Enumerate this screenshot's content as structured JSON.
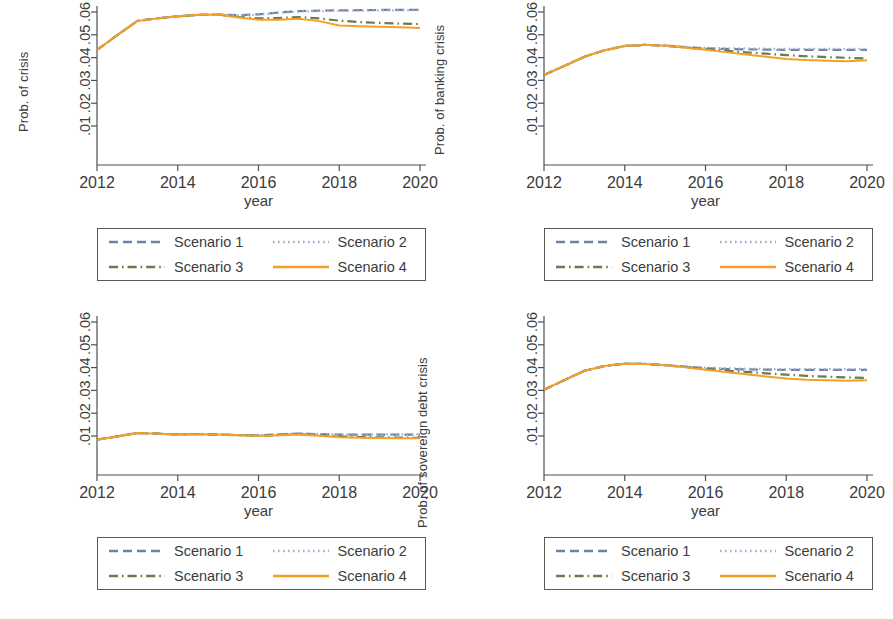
{
  "figure": {
    "width": 893,
    "height": 619,
    "background": "#ffffff"
  },
  "series_styles": [
    {
      "name": "Scenario 1",
      "color": "#6e80a6",
      "dash": "dashed"
    },
    {
      "name": "Scenario 2",
      "color": "#9fb0cc",
      "dash": "dotted"
    },
    {
      "name": "Scenario 3",
      "color": "#6d7a4a",
      "dash": "dashdot"
    },
    {
      "name": "Scenario 4",
      "color": "#f4a028",
      "dash": "solid"
    }
  ],
  "legend": {
    "entries": [
      {
        "label": "Scenario 1",
        "color": "#6e80a6",
        "dash": "dashed"
      },
      {
        "label": "Scenario 2",
        "color": "#9fb0cc",
        "dash": "dotted"
      },
      {
        "label": "Scenario 3",
        "color": "#6d7a4a",
        "dash": "dashdot"
      },
      {
        "label": "Scenario 4",
        "color": "#f4a028",
        "dash": "solid"
      }
    ]
  },
  "panels": [
    {
      "id": "top-left",
      "ylabel_left": "Prob. of crisis",
      "ylabel_right": "",
      "xlabel": "year",
      "yticklabels": [
        ".01",
        ".02",
        ".03",
        ".04",
        ".05",
        ".06"
      ],
      "xticklabels": [
        "2012",
        "2014",
        "2016",
        "2018",
        "2020"
      ]
    },
    {
      "id": "top-right",
      "ylabel_left": "Prob. of banking crisis",
      "ylabel_right": "",
      "xlabel": "year",
      "yticklabels": [
        ".01",
        ".02",
        ".03",
        ".04",
        ".05",
        ".06"
      ],
      "xticklabels": [
        "2012",
        "2014",
        "2016",
        "2018",
        "2020"
      ]
    },
    {
      "id": "bottom-left",
      "ylabel_left": "",
      "ylabel_right": "",
      "xlabel": "year",
      "yticklabels": [
        ".01",
        ".02",
        ".03",
        ".04",
        ".05",
        ".06"
      ],
      "xticklabels": [
        "2012",
        "2014",
        "2016",
        "2018",
        "2020"
      ]
    },
    {
      "id": "bottom-right",
      "ylabel_left": "Prob. of sovereign debt crisis",
      "ylabel_right": "",
      "xlabel": "year",
      "yticklabels": [
        ".01",
        ".02",
        ".03",
        ".04",
        ".05",
        ".06"
      ],
      "xticklabels": [
        "2012",
        "2014",
        "2016",
        "2018",
        "2020"
      ]
    }
  ],
  "chart_data": [
    {
      "id": "top-left",
      "type": "line",
      "title": "",
      "xlabel": "year",
      "ylabel": "Prob. of crisis",
      "xlim": [
        2012,
        2020
      ],
      "ylim": [
        0.0,
        0.065
      ],
      "yticks": [
        0.01,
        0.02,
        0.03,
        0.04,
        0.05,
        0.06
      ],
      "xticks": [
        2012,
        2014,
        2016,
        2018,
        2020
      ],
      "grid": false,
      "legend_position": "below",
      "x": [
        2012,
        2012.5,
        2013,
        2013.5,
        2014,
        2014.5,
        2015,
        2015.5,
        2016,
        2016.5,
        2017,
        2017.5,
        2018,
        2018.5,
        2019,
        2019.5,
        2020
      ],
      "series": [
        {
          "name": "Scenario 1",
          "color": "#6e80a6",
          "dash": "dashed",
          "values": [
            0.0434,
            0.0498,
            0.0561,
            0.0572,
            0.0581,
            0.0587,
            0.0589,
            0.0586,
            0.059,
            0.0598,
            0.0604,
            0.0606,
            0.0607,
            0.0608,
            0.0609,
            0.0609,
            0.061
          ]
        },
        {
          "name": "Scenario 2",
          "color": "#9fb0cc",
          "dash": "dotted",
          "values": [
            0.0434,
            0.0498,
            0.0561,
            0.0572,
            0.0581,
            0.0587,
            0.0589,
            0.0585,
            0.0588,
            0.0596,
            0.0602,
            0.0604,
            0.0605,
            0.0606,
            0.0607,
            0.0607,
            0.0608
          ]
        },
        {
          "name": "Scenario 3",
          "color": "#6d7a4a",
          "dash": "dashdot",
          "values": [
            0.0434,
            0.0498,
            0.0561,
            0.0572,
            0.0581,
            0.0587,
            0.0589,
            0.0578,
            0.0572,
            0.0574,
            0.0578,
            0.0572,
            0.0562,
            0.0556,
            0.0552,
            0.0549,
            0.0547
          ]
        },
        {
          "name": "Scenario 4",
          "color": "#f4a028",
          "dash": "solid",
          "values": [
            0.0434,
            0.0498,
            0.0561,
            0.0572,
            0.0581,
            0.0587,
            0.0589,
            0.0576,
            0.0566,
            0.0566,
            0.057,
            0.056,
            0.0541,
            0.0538,
            0.0535,
            0.0533,
            0.053
          ]
        }
      ]
    },
    {
      "id": "top-right",
      "type": "line",
      "title": "",
      "xlabel": "year",
      "ylabel": "Prob. of banking crisis",
      "xlim": [
        2012,
        2020
      ],
      "ylim": [
        0.0,
        0.065
      ],
      "yticks": [
        0.01,
        0.02,
        0.03,
        0.04,
        0.05,
        0.06
      ],
      "xticks": [
        2012,
        2014,
        2016,
        2018,
        2020
      ],
      "grid": false,
      "legend_position": "below",
      "x": [
        2012,
        2012.5,
        2013,
        2013.5,
        2014,
        2014.5,
        2015,
        2015.5,
        2016,
        2016.5,
        2017,
        2017.5,
        2018,
        2018.5,
        2019,
        2019.5,
        2020
      ],
      "series": [
        {
          "name": "Scenario 1",
          "color": "#6e80a6",
          "dash": "dashed",
          "values": [
            0.0324,
            0.0363,
            0.0404,
            0.0432,
            0.0451,
            0.0456,
            0.0453,
            0.0446,
            0.0441,
            0.0438,
            0.0436,
            0.0435,
            0.0434,
            0.0434,
            0.0434,
            0.0434,
            0.0434
          ]
        },
        {
          "name": "Scenario 2",
          "color": "#9fb0cc",
          "dash": "dotted",
          "values": [
            0.0324,
            0.0363,
            0.0404,
            0.0432,
            0.0451,
            0.0456,
            0.0453,
            0.0447,
            0.0443,
            0.0441,
            0.044,
            0.0439,
            0.0438,
            0.0438,
            0.0438,
            0.0438,
            0.0438
          ]
        },
        {
          "name": "Scenario 3",
          "color": "#6d7a4a",
          "dash": "dashdot",
          "values": [
            0.0324,
            0.0363,
            0.0404,
            0.0432,
            0.0451,
            0.0456,
            0.0452,
            0.0444,
            0.0437,
            0.043,
            0.0423,
            0.0417,
            0.0411,
            0.0406,
            0.0402,
            0.0399,
            0.0396
          ]
        },
        {
          "name": "Scenario 4",
          "color": "#f4a028",
          "dash": "solid",
          "values": [
            0.0324,
            0.0363,
            0.0404,
            0.0432,
            0.0451,
            0.0456,
            0.0452,
            0.0443,
            0.0434,
            0.0424,
            0.0414,
            0.0404,
            0.0394,
            0.0389,
            0.0386,
            0.0384,
            0.0388
          ]
        }
      ]
    },
    {
      "id": "bottom-left",
      "type": "line",
      "title": "",
      "xlabel": "year",
      "ylabel": "",
      "xlim": [
        2012,
        2020
      ],
      "ylim": [
        0.0,
        0.065
      ],
      "yticks": [
        0.01,
        0.02,
        0.03,
        0.04,
        0.05,
        0.06
      ],
      "xticks": [
        2012,
        2014,
        2016,
        2018,
        2020
      ],
      "grid": false,
      "legend_position": "below",
      "x": [
        2012,
        2012.5,
        2013,
        2013.5,
        2014,
        2014.5,
        2015,
        2015.5,
        2016,
        2016.5,
        2017,
        2017.5,
        2018,
        2018.5,
        2019,
        2019.5,
        2020
      ],
      "series": [
        {
          "name": "Scenario 1",
          "color": "#6e80a6",
          "dash": "dashed",
          "values": [
            0.0084,
            0.0098,
            0.0113,
            0.011,
            0.0107,
            0.0108,
            0.0107,
            0.0104,
            0.0103,
            0.0107,
            0.0111,
            0.0108,
            0.0106,
            0.0106,
            0.0106,
            0.0106,
            0.0106
          ]
        },
        {
          "name": "Scenario 2",
          "color": "#9fb0cc",
          "dash": "dotted",
          "values": [
            0.0084,
            0.0098,
            0.0113,
            0.011,
            0.0107,
            0.0108,
            0.0107,
            0.0104,
            0.0104,
            0.0108,
            0.0112,
            0.0109,
            0.0107,
            0.0107,
            0.0107,
            0.0107,
            0.0107
          ]
        },
        {
          "name": "Scenario 3",
          "color": "#6d7a4a",
          "dash": "dashdot",
          "values": [
            0.0084,
            0.0098,
            0.0113,
            0.011,
            0.0107,
            0.0108,
            0.0107,
            0.0103,
            0.0101,
            0.0104,
            0.0108,
            0.0103,
            0.0098,
            0.0096,
            0.0094,
            0.0093,
            0.0092
          ]
        },
        {
          "name": "Scenario 4",
          "color": "#f4a028",
          "dash": "solid",
          "values": [
            0.0084,
            0.0098,
            0.0113,
            0.011,
            0.0107,
            0.0108,
            0.0107,
            0.0103,
            0.01,
            0.0103,
            0.0107,
            0.0101,
            0.0094,
            0.0092,
            0.0091,
            0.009,
            0.009
          ]
        }
      ]
    },
    {
      "id": "bottom-right",
      "type": "line",
      "title": "",
      "xlabel": "year",
      "ylabel": "Prob. of sovereign debt crisis",
      "xlim": [
        2012,
        2020
      ],
      "ylim": [
        0.0,
        0.065
      ],
      "yticks": [
        0.01,
        0.02,
        0.03,
        0.04,
        0.05,
        0.06
      ],
      "xticks": [
        2012,
        2014,
        2016,
        2018,
        2020
      ],
      "grid": false,
      "legend_position": "below",
      "x": [
        2012,
        2012.5,
        2013,
        2013.5,
        2014,
        2014.5,
        2015,
        2015.5,
        2016,
        2016.5,
        2017,
        2017.5,
        2018,
        2018.5,
        2019,
        2019.5,
        2020
      ],
      "series": [
        {
          "name": "Scenario 1",
          "color": "#6e80a6",
          "dash": "dashed",
          "values": [
            0.0303,
            0.0345,
            0.0386,
            0.0407,
            0.0417,
            0.0416,
            0.0411,
            0.0404,
            0.0398,
            0.0394,
            0.0392,
            0.0391,
            0.039,
            0.039,
            0.039,
            0.039,
            0.039
          ]
        },
        {
          "name": "Scenario 2",
          "color": "#9fb0cc",
          "dash": "dotted",
          "values": [
            0.0303,
            0.0345,
            0.0386,
            0.0407,
            0.0417,
            0.0416,
            0.0411,
            0.0405,
            0.04,
            0.0397,
            0.0395,
            0.0394,
            0.0393,
            0.0393,
            0.0393,
            0.0393,
            0.0393
          ]
        },
        {
          "name": "Scenario 3",
          "color": "#6d7a4a",
          "dash": "dashdot",
          "values": [
            0.0303,
            0.0345,
            0.0386,
            0.0407,
            0.0417,
            0.0416,
            0.041,
            0.0402,
            0.0394,
            0.0387,
            0.0381,
            0.0375,
            0.0369,
            0.0364,
            0.036,
            0.0357,
            0.0355
          ]
        },
        {
          "name": "Scenario 4",
          "color": "#f4a028",
          "dash": "solid",
          "values": [
            0.0303,
            0.0345,
            0.0386,
            0.0407,
            0.0417,
            0.0416,
            0.041,
            0.0401,
            0.0391,
            0.0381,
            0.0371,
            0.0361,
            0.0352,
            0.0347,
            0.0344,
            0.0342,
            0.0345
          ]
        }
      ]
    }
  ]
}
